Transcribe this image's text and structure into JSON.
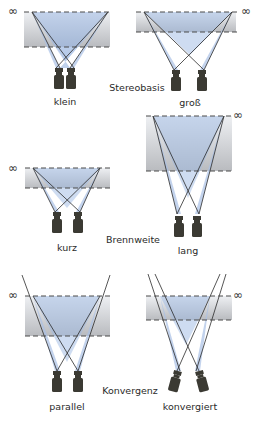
{
  "infinity_symbol": "∞",
  "categories": [
    {
      "name": "Stereobasis",
      "label_pos": [
        137,
        88
      ]
    },
    {
      "name": "Brennweite",
      "label_pos": [
        133,
        240
      ]
    },
    {
      "name": "Konvergenz",
      "label_pos": [
        130,
        391
      ]
    }
  ],
  "panels": [
    {
      "id": "klein",
      "label": "klein",
      "category": "Stereobasis"
    },
    {
      "id": "gross",
      "label": "groß",
      "category": "Stereobasis"
    },
    {
      "id": "kurz",
      "label": "kurz",
      "category": "Brennweite"
    },
    {
      "id": "lang",
      "label": "lang",
      "category": "Brennweite"
    },
    {
      "id": "parallel",
      "label": "parallel",
      "category": "Konvergenz"
    },
    {
      "id": "konvergiert",
      "label": "konvergiert",
      "category": "Konvergenz"
    }
  ],
  "colors": {
    "band_top": "#e4e6ea",
    "band_bottom": "#b4b6ba",
    "cone_fill": "#8fb0de",
    "cone_overlap": "#5b83c9",
    "line": "#2b2b2b",
    "dash": "#4a4a4a",
    "camera": "#3b3a33"
  }
}
